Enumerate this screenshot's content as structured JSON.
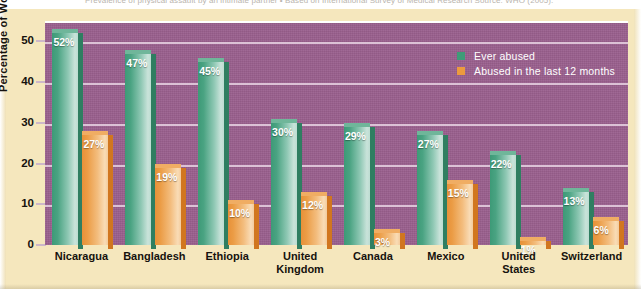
{
  "caption": {
    "text": "Prevalence of physical assault by an intimate partner  •  Based on International Survey of Medical Research   Source: WHO (2005)."
  },
  "chart_data": {
    "type": "bar",
    "title": "",
    "xlabel": "",
    "ylabel": "Percentage of Women",
    "ylim": [
      0,
      55
    ],
    "yticks": [
      "0",
      "10",
      "20",
      "30",
      "40",
      "50"
    ],
    "grid": true,
    "legend_position": "top-right",
    "categories": [
      "Nicaragua",
      "Bangladesh",
      "Ethiopia",
      "United Kingdom",
      "Canada",
      "Mexico",
      "United States",
      "Switzerland"
    ],
    "series": [
      {
        "name": "Ever abused",
        "color": "#3f9c78",
        "values": [
          52,
          47,
          45,
          30,
          29,
          27,
          22,
          13
        ],
        "labels": [
          "52%",
          "47%",
          "45%",
          "30%",
          "29%",
          "27%",
          "22%",
          "13%"
        ]
      },
      {
        "name": "Abused in the last 12 months",
        "color": "#ec9a3e",
        "values": [
          27,
          19,
          10,
          12,
          3,
          15,
          1,
          6
        ],
        "labels": [
          "27%",
          "19%",
          "10%",
          "12%",
          "3%",
          "15%",
          "1%",
          "6%"
        ]
      }
    ]
  },
  "colors": {
    "page_background": "#f5e7bd",
    "plot_background": "#9a5f8d",
    "gridline": "#e7d3e3",
    "series_green": "#3f9c78",
    "series_orange": "#ec9a3e",
    "axis_text": "#16120e",
    "legend_text": "#ffffff"
  }
}
